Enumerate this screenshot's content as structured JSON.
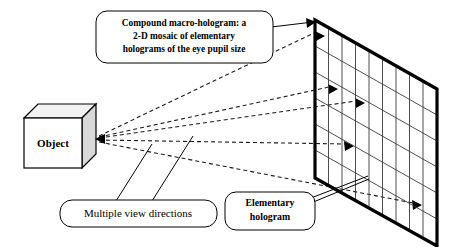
{
  "figure": {
    "background_color": "#ffffff",
    "line_color": "#000000",
    "width": 456,
    "height": 247
  },
  "object": {
    "label": "Object",
    "front_fill": "#ffffff",
    "top_fill": "#f2f2f2",
    "side_fill": "#d9d9d9"
  },
  "callouts": {
    "macro_hologram": {
      "name": "compound-macro-hologram-callout",
      "lines": [
        "Compound macro-hologram: a",
        "2-D mosaic of elementary",
        "holograms of the eye pupil size"
      ],
      "bold": true
    },
    "view_directions": {
      "name": "multiple-view-directions-callout",
      "lines": [
        "Multiple view directions"
      ],
      "bold": false
    },
    "elementary_hologram": {
      "name": "elementary-hologram-callout",
      "lines": [
        "Elementary",
        "hologram"
      ],
      "bold": true
    }
  },
  "hologram_plane": {
    "name": "compound-macro-hologram-plane",
    "columns": 9,
    "rows": 6,
    "edge_color": "#000000",
    "grid_color": "#3a3a3a"
  },
  "rays": {
    "name": "multiple-view-direction-rays",
    "count": 5,
    "style": "dashed",
    "color": "#1a1a1a",
    "converge_label": "Object"
  }
}
